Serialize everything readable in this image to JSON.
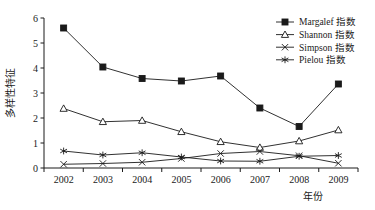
{
  "chart_data": {
    "type": "line",
    "title": "",
    "xlabel": "年份",
    "ylabel": "多样性特征",
    "categories": [
      "2002",
      "2003",
      "2004",
      "2005",
      "2006",
      "2007",
      "2008",
      "2009"
    ],
    "ylim": [
      0,
      6
    ],
    "yticks": [
      "0",
      "1",
      "2",
      "3",
      "4",
      "5",
      "6"
    ],
    "grid": false,
    "legend_position": "top-right",
    "series": [
      {
        "name": "Margalef 指数",
        "marker": "filled-square",
        "values": [
          5.6,
          4.04,
          3.58,
          3.48,
          3.68,
          2.4,
          1.66,
          3.36
        ]
      },
      {
        "name": "Shannon 指数",
        "marker": "open-triangle",
        "values": [
          2.38,
          1.85,
          1.9,
          1.45,
          1.05,
          0.82,
          1.08,
          1.52
        ]
      },
      {
        "name": "Simpson 指数",
        "marker": "cross-x",
        "values": [
          0.15,
          0.18,
          0.23,
          0.38,
          0.58,
          0.66,
          0.49,
          0.19
        ]
      },
      {
        "name": "Pielou 指数",
        "marker": "asterisk",
        "values": [
          0.68,
          0.52,
          0.61,
          0.44,
          0.28,
          0.27,
          0.47,
          0.5
        ]
      }
    ]
  },
  "axes": {
    "y_label": "多样性特征",
    "x_label": "年份"
  }
}
